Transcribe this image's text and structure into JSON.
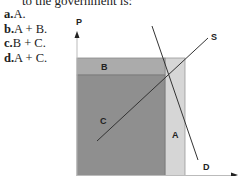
{
  "question": {
    "stem_fragment": "to the government is:",
    "options": [
      {
        "letter": "a.",
        "text": "A."
      },
      {
        "letter": "b.",
        "text": "A + B."
      },
      {
        "letter": "c.",
        "text": "B + C."
      },
      {
        "letter": "d.",
        "text": "A + C."
      }
    ]
  },
  "diagram": {
    "y_axis_label": "P",
    "x_axis_label": "Q",
    "supply_label": "S",
    "demand_label": "D",
    "region_labels": {
      "a": "A",
      "b": "B",
      "c": "C"
    },
    "colors": {
      "region_c": "#8f8f8f",
      "region_b": "#ababab",
      "region_a": "#d6d6d6",
      "lines": "#333333"
    }
  }
}
